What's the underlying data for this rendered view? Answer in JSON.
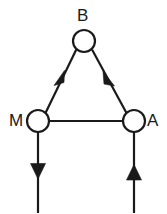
{
  "diagram": {
    "type": "directed-graph",
    "title": "",
    "background_color": "#ffffff",
    "stroke_color": "#1a1a1a",
    "node_fill_color": "#ffffff",
    "stroke_width": 2.2,
    "nodes": [
      {
        "id": "B",
        "label": "B",
        "cx": 84,
        "cy": 41,
        "r": 11,
        "label_x": 77,
        "label_y": 7
      },
      {
        "id": "M",
        "label": "M",
        "cx": 38,
        "cy": 121,
        "r": 11,
        "label_x": 9,
        "label_y": 112
      },
      {
        "id": "A",
        "label": "A",
        "cx": 134,
        "cy": 121,
        "r": 11,
        "label_x": 147,
        "label_y": 112
      }
    ],
    "edges": [
      {
        "id": "edge-b-m",
        "from": "B",
        "to": "M",
        "directed": true,
        "arrow_position": "midpoint",
        "arrow_direction": "down-left"
      },
      {
        "id": "edge-a-b",
        "from": "A",
        "to": "B",
        "directed": true,
        "arrow_position": "midpoint",
        "arrow_direction": "up-left"
      },
      {
        "id": "edge-m-a",
        "from": "M",
        "to": "A",
        "directed": false,
        "arrow_position": "none",
        "arrow_direction": "none"
      }
    ],
    "external_edges": [
      {
        "id": "edge-m-out",
        "from": "M",
        "to": "outside-bottom",
        "directed": true,
        "arrow_direction": "down",
        "x": 38,
        "y_start": 132,
        "y_end": 212
      },
      {
        "id": "edge-in-a",
        "from": "outside-bottom",
        "to": "A",
        "directed": true,
        "arrow_direction": "up",
        "x": 134,
        "y_start": 212,
        "y_end": 132
      }
    ]
  }
}
